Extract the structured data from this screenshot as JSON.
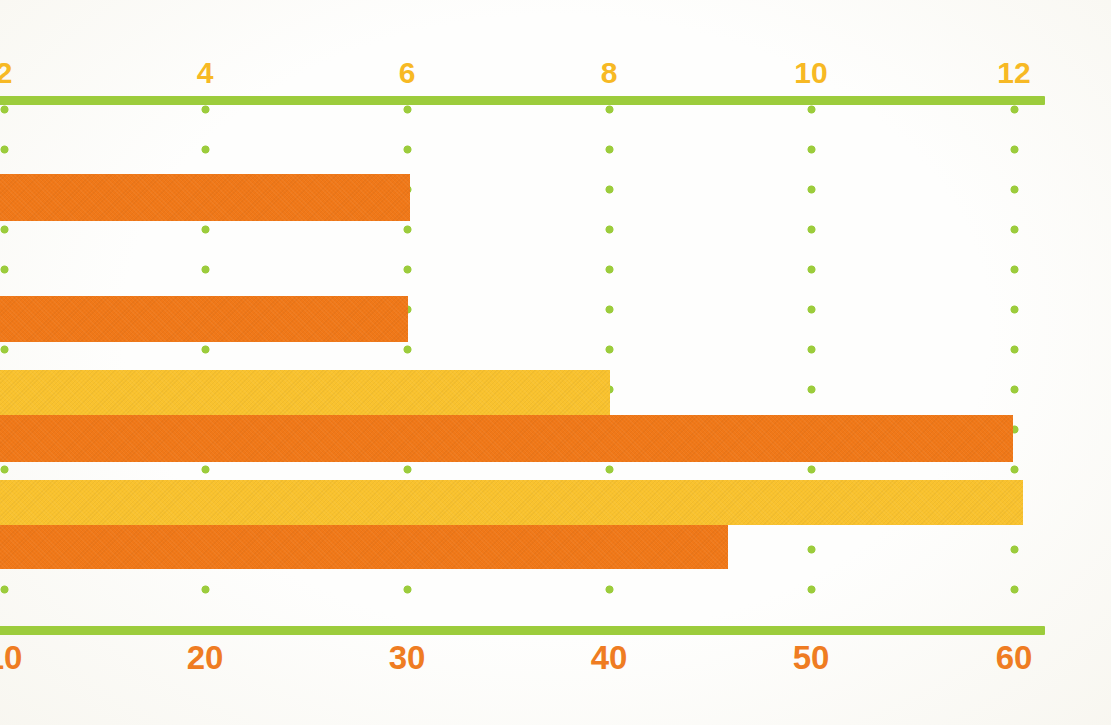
{
  "chart_data": {
    "type": "bar",
    "orientation": "horizontal",
    "title": "",
    "subtitle": "",
    "xlabel": "",
    "ylabel": "",
    "grid": "vertical dotted gridlines at each top-axis tick",
    "legend": "none",
    "note": "Cropped chart region: category labels and bar value labels are outside the visible frame. Two x-axes are drawn: a top axis (yellow labels, 2-12 scale) and a bottom axis (orange labels, 10-60 scale). Bars are measured against the top axis.",
    "axes": {
      "top": {
        "label_color": "#f7b924",
        "tick_labels": [
          "2",
          "4",
          "6",
          "8",
          "10",
          "12"
        ],
        "tick_values": [
          2,
          4,
          6,
          8,
          10,
          12
        ],
        "tick_positions_px": [
          4,
          205,
          407,
          609,
          811,
          1014
        ],
        "visible_range": [
          2,
          12
        ],
        "first_label_clipped": true
      },
      "bottom": {
        "label_color": "#ef7c22",
        "tick_labels": [
          "10",
          "20",
          "30",
          "40",
          "50",
          "60"
        ],
        "tick_values": [
          10,
          20,
          30,
          40,
          50,
          60
        ],
        "tick_positions_px": [
          4,
          205,
          407,
          609,
          811,
          1014
        ],
        "visible_range": [
          10,
          60
        ],
        "first_label_clipped": true
      }
    },
    "bars": [
      {
        "index": 1,
        "series": "orange",
        "color": "#f07818",
        "top_axis_value": 6.0,
        "bottom_axis_value": 30,
        "end_px": 410,
        "y_px": 174,
        "height_px": 47
      },
      {
        "index": 2,
        "series": "orange",
        "color": "#f07818",
        "top_axis_value": 6.0,
        "bottom_axis_value": 30,
        "end_px": 408,
        "y_px": 296,
        "height_px": 46
      },
      {
        "index": 3,
        "series": "yellow",
        "color": "#f9c22e",
        "top_axis_value": 8.0,
        "bottom_axis_value": 40,
        "end_px": 610,
        "y_px": 370,
        "height_px": 45
      },
      {
        "index": 4,
        "series": "orange",
        "color": "#f07818",
        "top_axis_value": 12.0,
        "bottom_axis_value": 60,
        "end_px": 1013,
        "y_px": 415,
        "height_px": 47
      },
      {
        "index": 5,
        "series": "yellow",
        "color": "#f9c22e",
        "top_axis_value": 12.1,
        "bottom_axis_value": 60,
        "end_px": 1023,
        "y_px": 480,
        "height_px": 45
      },
      {
        "index": 6,
        "series": "orange",
        "color": "#f07818",
        "top_axis_value": 7.2,
        "bottom_axis_value": 46,
        "end_px": 728,
        "y_px": 525,
        "height_px": 44
      }
    ],
    "series": [
      {
        "name": "orange",
        "color": "#f07818",
        "values": [
          6.0,
          6.0,
          12.0,
          7.2
        ]
      },
      {
        "name": "yellow",
        "color": "#f9c22e",
        "values": [
          8.0,
          12.1
        ]
      }
    ],
    "colors": {
      "orange": "#f07818",
      "yellow": "#f9c22e",
      "axis_green": "#9ccc3c",
      "top_label": "#f7b924",
      "bottom_label": "#ef7c22",
      "background": "#fefefd"
    }
  }
}
